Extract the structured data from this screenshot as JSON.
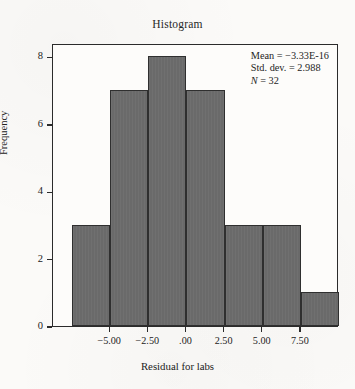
{
  "chart_data": {
    "type": "bar",
    "title": "Histogram",
    "xlabel": "Residual for labs",
    "ylabel": "Frequency",
    "categories": [
      "-6.25",
      "-3.75",
      "-1.25",
      "1.25",
      "3.75",
      "6.25",
      "8.75"
    ],
    "bin_edges": [
      -7.5,
      -5.0,
      -2.5,
      0.0,
      2.5,
      5.0,
      7.5,
      10.0
    ],
    "bin_centers": [
      -6.25,
      -3.75,
      -1.25,
      1.25,
      3.75,
      6.25,
      8.75
    ],
    "values": [
      3,
      7,
      8,
      7,
      3,
      3,
      1
    ],
    "xlim": [
      -8.75,
      10.0
    ],
    "ylim": [
      0,
      8.4
    ],
    "grid": false,
    "legend": "none",
    "bar_color": "#6a6a6a",
    "bar_edge_color": "#2f2f2f",
    "xticks": [
      -5.0,
      -2.5,
      0.0,
      2.5,
      5.0,
      7.5
    ],
    "xtick_labels": [
      "−5.00",
      "−2.50",
      ".00",
      "2.50",
      "5.00",
      "7.50"
    ],
    "yticks": [
      0,
      2,
      4,
      6,
      8
    ],
    "ytick_labels": [
      "0",
      "2",
      "4",
      "6",
      "8"
    ],
    "annotations": {
      "mean_label": "Mean = −3.33E-16",
      "std_dev_label": "Std. dev. = 2.988",
      "n_symbol": "N",
      "n_value_label": " = 32",
      "mean": -3.33e-16,
      "std_dev": 2.988,
      "n": 32
    }
  }
}
